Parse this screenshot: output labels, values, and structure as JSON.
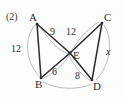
{
  "problem": {
    "number_label": "(2)"
  },
  "figure": {
    "vertices": [
      {
        "id": "A",
        "label": "A",
        "x": 33,
        "y": 19
      },
      {
        "id": "B",
        "label": "B",
        "x": 39,
        "y": 82
      },
      {
        "id": "C",
        "label": "C",
        "x": 103,
        "y": 19
      },
      {
        "id": "D",
        "label": "D",
        "x": 94,
        "y": 84
      },
      {
        "id": "E",
        "label": "E",
        "x": 70,
        "y": 52
      }
    ],
    "measures": [
      {
        "id": "AB",
        "text": "12",
        "x": 16,
        "y": 45
      },
      {
        "id": "AE",
        "text": "9",
        "x": 50,
        "y": 31
      },
      {
        "id": "EC",
        "text": "12",
        "x": 67,
        "y": 30
      },
      {
        "id": "BE",
        "text": "6",
        "x": 50,
        "y": 68
      },
      {
        "id": "ED",
        "text": "8",
        "x": 74,
        "y": 72
      },
      {
        "id": "CD",
        "text": "x",
        "x": 106,
        "y": 50
      }
    ],
    "colors": {
      "stroke": "#2b2b2b",
      "arc": "#a9a9a9",
      "background": "#fdfdfd"
    }
  }
}
